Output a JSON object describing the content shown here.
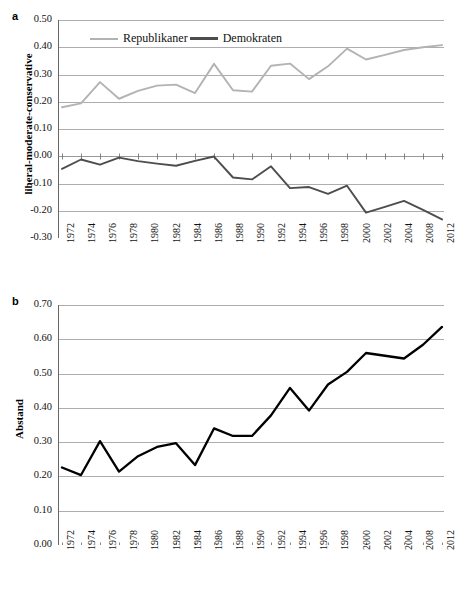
{
  "figure": {
    "panel_a_letter": "a",
    "panel_b_letter": "b"
  },
  "colors": {
    "republikaner": "#b3b3b3",
    "demokraten": "#4d4d4d",
    "abstand": "#000000",
    "grid": "#999999",
    "axis": "#666666"
  },
  "panel_a": {
    "ylabel": "liberal-moderate-conservative",
    "legend": [
      {
        "label": "Republikaner",
        "color": "#b3b3b3"
      },
      {
        "label": "Demokraten",
        "color": "#4d4d4d"
      }
    ],
    "yticks": [
      "0.50",
      "0.40",
      "0.30",
      "0.20",
      "0.10",
      "0.00",
      "-0.10",
      "-0.20",
      "-0.30"
    ],
    "xticks": [
      "1972",
      "1974",
      "1976",
      "1978",
      "1980",
      "1982",
      "1984",
      "1986",
      "1988",
      "1990",
      "1992",
      "1994",
      "1996",
      "1998",
      "2000",
      "2002",
      "2004",
      "2008",
      "2012"
    ]
  },
  "panel_b": {
    "ylabel": "Abstand",
    "yticks": [
      "0.70",
      "0.60",
      "0.50",
      "0.40",
      "0.30",
      "0.20",
      "0.10",
      "0.00"
    ],
    "xticks": [
      "1972",
      "1974",
      "1976",
      "1978",
      "1980",
      "1982",
      "1984",
      "1986",
      "1988",
      "1990",
      "1992",
      "1994",
      "1996",
      "1998",
      "2000",
      "2002",
      "2004",
      "2008",
      "2012"
    ]
  },
  "chart_data": [
    {
      "type": "line",
      "panel": "a",
      "title": "",
      "xlabel": "",
      "ylabel": "liberal-moderate-conservative",
      "ylim": [
        -0.3,
        0.5
      ],
      "ytick_step": 0.1,
      "grid": true,
      "legend_position": "top-center",
      "x": [
        1972,
        1974,
        1976,
        1978,
        1980,
        1982,
        1984,
        1986,
        1988,
        1990,
        1992,
        1994,
        1996,
        1998,
        2000,
        2002,
        2004,
        2006,
        2008,
        2010,
        2012
      ],
      "series": [
        {
          "name": "Republikaner",
          "color": "#b3b3b3",
          "values": [
            0.18,
            0.194,
            0.272,
            0.211,
            0.24,
            0.259,
            0.263,
            0.232,
            0.339,
            0.242,
            0.237,
            0.332,
            0.34,
            0.283,
            0.33,
            0.395,
            0.355,
            0.372,
            0.39,
            0.4,
            0.408
          ]
        },
        {
          "name": "Demokraten",
          "color": "#4d4d4d",
          "values": [
            -0.046,
            -0.012,
            -0.031,
            -0.005,
            -0.018,
            -0.027,
            -0.035,
            -0.017,
            -0.001,
            -0.078,
            -0.085,
            -0.037,
            -0.117,
            -0.113,
            -0.138,
            -0.108,
            -0.207,
            -0.186,
            -0.164,
            -0.197,
            -0.232
          ]
        }
      ]
    },
    {
      "type": "line",
      "panel": "b",
      "title": "",
      "xlabel": "",
      "ylabel": "Abstand",
      "ylim": [
        0.0,
        0.7
      ],
      "ytick_step": 0.1,
      "grid": true,
      "x": [
        1972,
        1974,
        1976,
        1978,
        1980,
        1982,
        1984,
        1986,
        1988,
        1990,
        1992,
        1994,
        1996,
        1998,
        2000,
        2002,
        2004,
        2006,
        2008,
        2010,
        2012
      ],
      "series": [
        {
          "name": "Abstand",
          "color": "#000000",
          "values": [
            0.226,
            0.204,
            0.303,
            0.214,
            0.259,
            0.286,
            0.297,
            0.233,
            0.34,
            0.318,
            0.318,
            0.378,
            0.458,
            0.392,
            0.468,
            0.505,
            0.56,
            0.552,
            0.544,
            0.584,
            0.636
          ]
        }
      ]
    }
  ]
}
